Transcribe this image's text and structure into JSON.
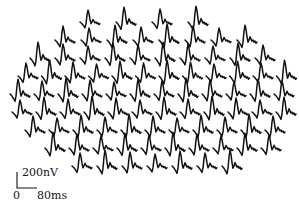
{
  "figure": {
    "type": "multifocal ERG trace array",
    "trace_color": "#111111",
    "background": "#ffffff",
    "rows": [
      {
        "y": 22,
        "x_start": 80,
        "count": 4,
        "step": 36
      },
      {
        "y": 40,
        "x_start": 55,
        "count": 8,
        "step": 26
      },
      {
        "y": 58,
        "x_start": 30,
        "count": 10,
        "step": 25
      },
      {
        "y": 76,
        "x_start": 18,
        "count": 12,
        "step": 23.5
      },
      {
        "y": 94,
        "x_start": 10,
        "count": 12,
        "step": 24
      },
      {
        "y": 112,
        "x_start": 12,
        "count": 12,
        "step": 24
      },
      {
        "y": 130,
        "x_start": 25,
        "count": 11,
        "step": 24
      },
      {
        "y": 148,
        "x_start": 45,
        "count": 10,
        "step": 24
      },
      {
        "y": 166,
        "x_start": 72,
        "count": 7,
        "step": 25
      }
    ]
  },
  "scale_bar": {
    "amplitude_label": "200nV",
    "time_label": "80ms",
    "origin_label": "0"
  }
}
